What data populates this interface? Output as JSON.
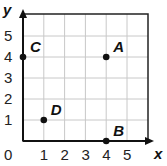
{
  "chart_data": {
    "type": "scatter",
    "title": "",
    "xlabel": "x",
    "ylabel": "y",
    "xlim": [
      0,
      5
    ],
    "ylim": [
      0,
      5
    ],
    "grid": true,
    "x_ticks": [
      "0",
      "1",
      "2",
      "3",
      "4",
      "5"
    ],
    "y_ticks": [
      "1",
      "2",
      "3",
      "4",
      "5"
    ],
    "points": [
      {
        "label": "A",
        "x": 4,
        "y": 4
      },
      {
        "label": "B",
        "x": 4,
        "y": 0
      },
      {
        "label": "C",
        "x": 0,
        "y": 4
      },
      {
        "label": "D",
        "x": 1,
        "y": 1
      }
    ]
  },
  "colors": {
    "grid": "#c8c8c8",
    "axis": "#111111",
    "point": "#111111"
  }
}
